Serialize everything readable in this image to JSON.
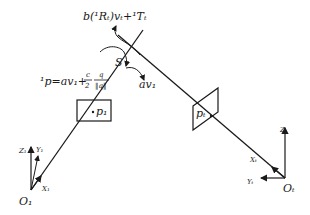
{
  "diagram": {
    "type": "geometric-projection",
    "labels": {
      "top_formula": "b(¹Rₜ)vₜ+¹Tₜ",
      "point_formula_lhs": "¹p=av₁+",
      "fraction_c": "c",
      "fraction_2": "2",
      "fraction_q": "q",
      "fraction_normq": "‖q‖",
      "S": "S",
      "av1": "av₁",
      "p1": "p₁",
      "pt": "pₜ",
      "Z1": "Z₁",
      "Y1": "Y₁",
      "X1": "X₁",
      "O1": "O₁",
      "Zt": "Zₜ",
      "Yt": "Yₜ",
      "Xt": "Xₜ",
      "Ot": "Oₜ"
    },
    "colors": {
      "ink": "#1a1a1a",
      "background": "#ffffff"
    }
  }
}
